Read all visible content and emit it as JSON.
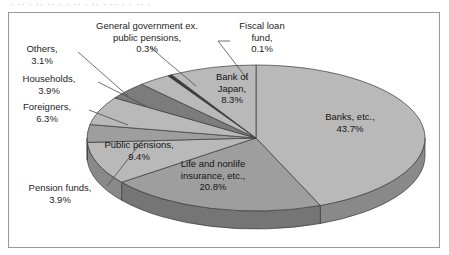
{
  "title_remnant": "· ··  · ··  ··  · ·  ·· ·  ··  · ··  · ·  ·· ·",
  "colors": {
    "frame": "#9a9a9a",
    "slice_light": "#b9b9b9",
    "slice_mid": "#9e9e9e",
    "slice_dark": "#7c7c7c",
    "slice_darkest": "#5f5f5f",
    "edge": "#3a3a3a",
    "leader_line": "#4a4a4a",
    "text": "#1d1d1d"
  },
  "chart_data": {
    "type": "pie",
    "title": "",
    "subtitle": "",
    "xlabel": "",
    "ylabel": "",
    "legend_position": "none",
    "grid": false,
    "units": "percent",
    "total": 100.0,
    "start_angle_deg": 0,
    "direction": "clockwise",
    "three_d": true,
    "categories": [
      "Banks, etc.",
      "Life and nonlife insurance, etc.",
      "Public pensions",
      "Pension funds",
      "Foreigners",
      "Households",
      "Others",
      "General government ex. public pensions",
      "Fiscal loan fund",
      "Bank of Japan"
    ],
    "values": [
      43.7,
      20.8,
      9.4,
      3.9,
      6.3,
      3.9,
      3.1,
      0.3,
      0.1,
      8.3
    ],
    "slices": [
      {
        "name": "Banks, etc.",
        "value": 43.7,
        "label_name": "Banks, etc.,",
        "label_value": "43.7%",
        "label_placement": "inside",
        "fill": "#b9b9b9"
      },
      {
        "name": "Life and nonlife insurance, etc.",
        "value": 20.8,
        "label_name_line1": "Life and nonlife",
        "label_name_line2": "insurance, etc.,",
        "label_value": "20.8%",
        "label_placement": "inside",
        "fill": "#9e9e9e"
      },
      {
        "name": "Public pensions",
        "value": 9.4,
        "label_name": "Public pensions,",
        "label_value": "9.4%",
        "label_placement": "inside",
        "fill": "#b9b9b9"
      },
      {
        "name": "Pension funds",
        "value": 3.9,
        "label_name": "Pension funds,",
        "label_value": "3.9%",
        "label_placement": "outside-left",
        "fill": "#9e9e9e"
      },
      {
        "name": "Foreigners",
        "value": 6.3,
        "label_name": "Foreigners,",
        "label_value": "6.3%",
        "label_placement": "outside-left",
        "fill": "#b9b9b9"
      },
      {
        "name": "Households",
        "value": 3.9,
        "label_name": "Households,",
        "label_value": "3.9%",
        "label_placement": "outside-left",
        "fill": "#7c7c7c"
      },
      {
        "name": "Others",
        "value": 3.1,
        "label_name": "Others,",
        "label_value": "3.1%",
        "label_placement": "outside-left",
        "fill": "#b9b9b9"
      },
      {
        "name": "General government ex. public pensions",
        "value": 0.3,
        "label_name_line1": "General government ex.",
        "label_name_line2": "public pensions,",
        "label_value": "0.3%",
        "label_placement": "outside-top",
        "fill": "#3a3a3a"
      },
      {
        "name": "Fiscal loan fund",
        "value": 0.1,
        "label_name_line1": "Fiscal loan",
        "label_name_line2": "fund,",
        "label_value": "0.1%",
        "label_placement": "outside-top",
        "fill": "#3a3a3a"
      },
      {
        "name": "Bank of Japan",
        "value": 8.3,
        "label_name_line1": "Bank of",
        "label_name_line2": "Japan,",
        "label_value": "8.3%",
        "label_placement": "inside",
        "fill": "#b9b9b9"
      }
    ]
  }
}
